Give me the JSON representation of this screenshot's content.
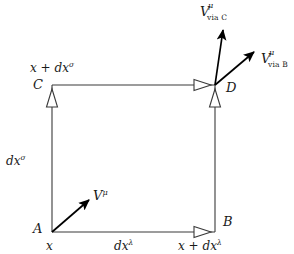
{
  "figure": {
    "type": "vector-parallel-transport-diagram",
    "background_color": "#ffffff",
    "line_color": "#3a3a3a",
    "vector_color": "#000000",
    "text_color": "#1a1a1a",
    "width": 294,
    "height": 254
  },
  "vertices": {
    "a": {
      "label": "A",
      "x": 52,
      "y": 232,
      "coord_text": "x"
    },
    "b": {
      "label": "B",
      "x": 215,
      "y": 232,
      "coord_prefix": "x + d",
      "coord_base": "x",
      "coord_sup": "λ"
    },
    "c": {
      "label": "C",
      "x": 52,
      "y": 85,
      "coord_prefix": "x + d",
      "coord_base": "x",
      "coord_sup": "σ"
    },
    "d": {
      "label": "D",
      "x": 215,
      "y": 85
    }
  },
  "edges": [
    {
      "name": "bottom-edge-ab",
      "from": "A",
      "to": "B",
      "label_prefix": "d",
      "label_base": "x",
      "label_sup": "λ",
      "arrowhead": "open-triangle"
    },
    {
      "name": "left-edge-ac",
      "from": "A",
      "to": "C",
      "label_prefix": "d",
      "label_base": "x",
      "label_sup": "σ",
      "arrowhead": "open-triangle"
    },
    {
      "name": "top-edge-cd",
      "from": "C",
      "to": "D",
      "label": "",
      "arrowhead": "open-triangle"
    },
    {
      "name": "right-edge-bd",
      "from": "B",
      "to": "D",
      "label": "",
      "arrowhead": "open-triangle"
    }
  ],
  "vectors": [
    {
      "name": "vector-v-at-a",
      "base": "V",
      "superscript": "μ",
      "subscript": "",
      "tail": {
        "x": 52,
        "y": 232
      },
      "tip": {
        "x": 92,
        "y": 198
      },
      "label_x": 96,
      "label_y": 190
    },
    {
      "name": "vector-v-via-c",
      "base": "V",
      "superscript": "μ",
      "subscript": "via C",
      "tail": {
        "x": 215,
        "y": 85
      },
      "tip": {
        "x": 224,
        "y": 26
      },
      "label_x": 202,
      "label_y": 6
    },
    {
      "name": "vector-v-via-b",
      "base": "V",
      "superscript": "μ",
      "subscript": "via B",
      "tail": {
        "x": 215,
        "y": 85
      },
      "tip": {
        "x": 258,
        "y": 49
      },
      "label_x": 262,
      "label_y": 53
    }
  ],
  "labels": {
    "coord_a": "x",
    "coord_b_prefix": "x + d",
    "coord_b_base": "x",
    "coord_b_sup": "λ",
    "coord_c_prefix": "x + d",
    "coord_c_base": "x",
    "coord_c_sup": "σ",
    "edge_bottom_prefix": "d",
    "edge_bottom_base": "x",
    "edge_bottom_sup": "λ",
    "edge_left_prefix": "d",
    "edge_left_base": "x",
    "edge_left_sup": "σ",
    "vertex_a": "A",
    "vertex_b": "B",
    "vertex_c": "C",
    "vertex_d": "D",
    "vector_base": "V",
    "vector_sup": "μ",
    "sub_via_c": "via C",
    "sub_via_b": "via B"
  }
}
